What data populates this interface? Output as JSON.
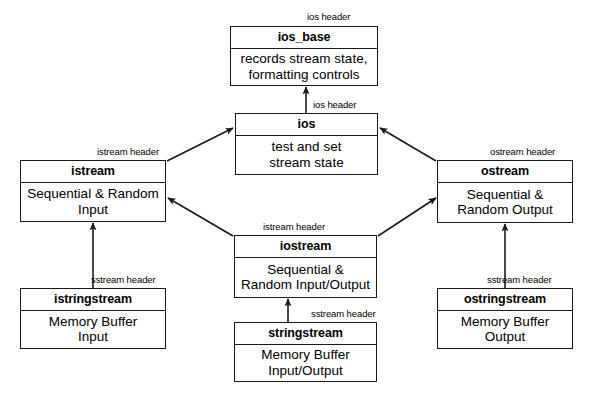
{
  "diagram": {
    "kind": "class-hierarchy",
    "nodes": [
      {
        "id": "ios_base",
        "title": "ios_base",
        "body": [
          "records stream state,",
          "formatting controls"
        ],
        "x": 230,
        "y": 26,
        "w": 148,
        "h": 60,
        "title_h": 22
      },
      {
        "id": "ios",
        "title": "ios",
        "body": [
          "test and set",
          "stream state"
        ],
        "x": 235,
        "y": 113,
        "w": 143,
        "h": 62,
        "title_h": 22
      },
      {
        "id": "istream",
        "title": "istream",
        "body": [
          "Sequential & Random",
          "Input"
        ],
        "x": 20,
        "y": 160,
        "w": 146,
        "h": 62,
        "title_h": 22
      },
      {
        "id": "ostream",
        "title": "ostream",
        "body": [
          "Sequential &",
          "Random Output"
        ],
        "x": 437,
        "y": 160,
        "w": 136,
        "h": 63,
        "title_h": 22
      },
      {
        "id": "iostream",
        "title": "iostream",
        "body": [
          "Sequential &",
          "Random Input/Output"
        ],
        "x": 234,
        "y": 235,
        "w": 143,
        "h": 63,
        "title_h": 22
      },
      {
        "id": "istringstream",
        "title": "istringstream",
        "body": [
          "Memory Buffer",
          "Input"
        ],
        "x": 20,
        "y": 288,
        "w": 146,
        "h": 61,
        "title_h": 22
      },
      {
        "id": "ostringstream",
        "title": "ostringstream",
        "body": [
          "Memory Buffer",
          "Output"
        ],
        "x": 437,
        "y": 288,
        "w": 136,
        "h": 61,
        "title_h": 22
      },
      {
        "id": "stringstream",
        "title": "stringstream",
        "body": [
          "Memory Buffer",
          "Input/Output"
        ],
        "x": 234,
        "y": 322,
        "w": 143,
        "h": 60,
        "title_h": 22
      }
    ],
    "edge_labels": [
      {
        "id": "label-ios-header-top",
        "text": "ios header",
        "x": 307,
        "y": 12
      },
      {
        "id": "label-ios-header-mid",
        "text": "ios header",
        "x": 313,
        "y": 100
      },
      {
        "id": "label-istream-header",
        "text": "istream header",
        "x": 97,
        "y": 147
      },
      {
        "id": "label-ostream-header",
        "text": "ostream header",
        "x": 490,
        "y": 147
      },
      {
        "id": "label-iostream-istream-header",
        "text": "istream header",
        "x": 263,
        "y": 222
      },
      {
        "id": "label-sstream-header-left",
        "text": "sstream header",
        "x": 91,
        "y": 275
      },
      {
        "id": "label-sstream-header-right",
        "text": "sstream header",
        "x": 487,
        "y": 275
      },
      {
        "id": "label-sstream-header-center",
        "text": "sstream header",
        "x": 311,
        "y": 309
      }
    ],
    "edges": [
      {
        "id": "edge-ios-to-ios_base",
        "from": "ios",
        "to": "ios_base",
        "relation": "inherits",
        "style": "vertical",
        "x1": 306,
        "y1": 113,
        "x2": 306,
        "y2": 87
      },
      {
        "id": "edge-istream-to-ios",
        "from": "istream",
        "to": "ios",
        "relation": "inherits",
        "style": "diagonal",
        "x1": 167,
        "y1": 161,
        "x2": 233,
        "y2": 128
      },
      {
        "id": "edge-ostream-to-ios",
        "from": "ostream",
        "to": "ios",
        "relation": "inherits",
        "style": "diagonal",
        "x1": 436,
        "y1": 161,
        "x2": 380,
        "y2": 128
      },
      {
        "id": "edge-iostream-to-istream",
        "from": "iostream",
        "to": "istream",
        "relation": "inherits",
        "style": "diagonal",
        "x1": 233,
        "y1": 236,
        "x2": 168,
        "y2": 198
      },
      {
        "id": "edge-iostream-to-ostream",
        "from": "iostream",
        "to": "ostream",
        "relation": "inherits",
        "style": "diagonal",
        "x1": 378,
        "y1": 236,
        "x2": 436,
        "y2": 198
      },
      {
        "id": "edge-istringstream-to-istream",
        "from": "istringstream",
        "to": "istream",
        "relation": "inherits",
        "style": "vertical",
        "x1": 93,
        "y1": 288,
        "x2": 93,
        "y2": 223
      },
      {
        "id": "edge-ostringstream-to-ostream",
        "from": "ostringstream",
        "to": "ostream",
        "relation": "inherits",
        "style": "vertical",
        "x1": 505,
        "y1": 288,
        "x2": 505,
        "y2": 224
      },
      {
        "id": "edge-stringstream-to-iostream",
        "from": "stringstream",
        "to": "iostream",
        "relation": "inherits",
        "style": "vertical",
        "x1": 288,
        "y1": 322,
        "x2": 288,
        "y2": 299
      }
    ]
  }
}
